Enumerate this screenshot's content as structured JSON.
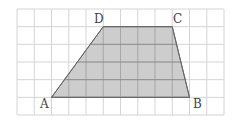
{
  "figure": {
    "type": "trapezoid-on-grid",
    "grid": {
      "columns": 12,
      "rows": 6,
      "origin_px": [
        17,
        9
      ],
      "cell_w": 17.25,
      "cell_h": 17.67,
      "line_color": "#d4d4d4"
    },
    "shape": {
      "name": "ABCD",
      "fill": "#c4c4c4",
      "stroke": "#666666",
      "vertices": {
        "A": {
          "label": "A",
          "grid": [
            2,
            5
          ]
        },
        "B": {
          "label": "B",
          "grid": [
            10,
            5
          ]
        },
        "C": {
          "label": "C",
          "grid": [
            9,
            1
          ]
        },
        "D": {
          "label": "D",
          "grid": [
            5,
            1
          ]
        }
      }
    },
    "labels": {
      "A": "A",
      "B": "B",
      "C": "C",
      "D": "D"
    }
  }
}
